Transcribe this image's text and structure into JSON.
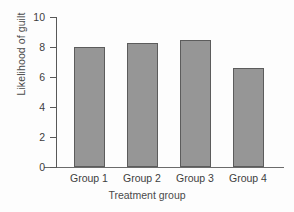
{
  "chart_data": {
    "type": "bar",
    "title": "",
    "categories": [
      "Group 1",
      "Group 2",
      "Group 3",
      "Group 4"
    ],
    "values": [
      8.0,
      8.3,
      8.45,
      6.6
    ],
    "xlabel": "Treatment group",
    "ylabel": "Likelihood of guilt",
    "ylim": [
      0,
      10
    ],
    "yticks": [
      0,
      2,
      4,
      6,
      8,
      10
    ],
    "ytick_labels": [
      "0",
      "2",
      "4",
      "6",
      "8",
      "10"
    ],
    "grid": false,
    "legend": false,
    "bar_color": "#969696",
    "bar_edge_color": "#5c5c5c",
    "axis_color": "#585858",
    "text_color": "#3d3d3d",
    "background": "#fdfdfd"
  }
}
